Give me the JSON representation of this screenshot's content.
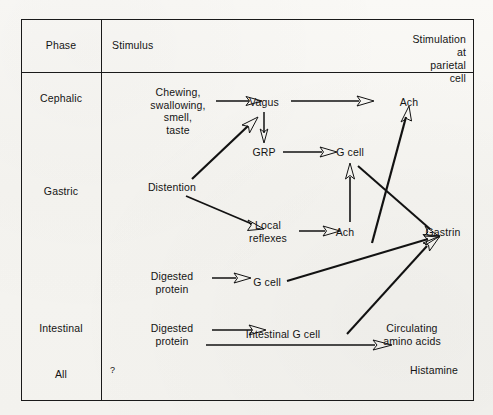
{
  "diagram": {
    "type": "flow-table",
    "ink_color": "#121212",
    "paper_color": "#f7f6f3"
  },
  "table": {
    "headers": {
      "phase": "Phase",
      "stimulus": "Stimulus",
      "stimulation": "Stimulation at\nparietal cell"
    },
    "phases": [
      {
        "label": "Cephalic"
      },
      {
        "label": "Gastric"
      },
      {
        "label": "Intestinal"
      },
      {
        "label": "All"
      }
    ]
  },
  "nodes": {
    "chewing": "Chewing,\nswallowing,\nsmell,\ntaste",
    "vagus": "Vagus",
    "grp": "GRP",
    "g_cell_top": "G cell",
    "ach_top": "Ach",
    "distention": "Distention",
    "local_reflexes": "Local\nreflexes",
    "ach_mid": "Ach",
    "gastrin": "Gastrin",
    "digested_protein_gastric": "Digested\nprotein",
    "g_cell_mid": "G cell",
    "digested_protein_intestinal": "Digested\nprotein",
    "intestinal_g_cell": "Intestinal G cell",
    "circulating_amino_acids": "Circulating\namino acids",
    "histamine": "Histamine",
    "unknown_stimulus": "?"
  },
  "edges": [
    {
      "from": "chewing",
      "to": "vagus"
    },
    {
      "from": "vagus",
      "to": "ach_top"
    },
    {
      "from": "vagus",
      "to": "grp"
    },
    {
      "from": "grp",
      "to": "g_cell_top"
    },
    {
      "from": "distention",
      "to": "vagus"
    },
    {
      "from": "distention",
      "to": "local_reflexes"
    },
    {
      "from": "local_reflexes",
      "to": "ach_mid"
    },
    {
      "from": "ach_mid",
      "to": "g_cell_top"
    },
    {
      "from": "g_cell_top",
      "to": "gastrin"
    },
    {
      "from": "gastrin",
      "to": "ach_top"
    },
    {
      "from": "digested_protein_gastric",
      "to": "g_cell_mid"
    },
    {
      "from": "g_cell_mid",
      "to": "gastrin"
    },
    {
      "from": "digested_protein_intestinal",
      "to": "intestinal_g_cell"
    },
    {
      "from": "intestinal_g_cell",
      "to": "gastrin"
    },
    {
      "from": "digested_protein_intestinal",
      "to": "circulating_amino_acids"
    }
  ]
}
